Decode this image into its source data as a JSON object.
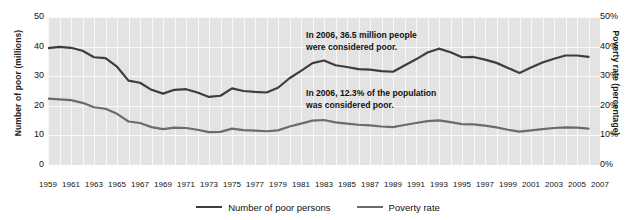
{
  "chart_data": {
    "type": "line",
    "title": "",
    "subtitle": "",
    "xlabel": "",
    "ylabel": "Number of poor (millions)",
    "y2label": "Poverty rate (percentage)",
    "grid": true,
    "legend_position": "bottom",
    "xlim": [
      1959,
      2007
    ],
    "ylim": [
      0,
      50
    ],
    "y2lim": [
      0,
      50
    ],
    "y_ticks": [
      "0",
      "10",
      "20",
      "30",
      "40",
      "50"
    ],
    "y_tick_values": [
      0,
      10,
      20,
      30,
      40,
      50
    ],
    "y2_ticks": [
      "0%",
      "10%",
      "20%",
      "30%",
      "40%",
      "50%"
    ],
    "y2_tick_values": [
      0,
      10,
      20,
      30,
      40,
      50
    ],
    "x_ticks": [
      "1959",
      "1961",
      "1963",
      "1965",
      "1967",
      "1969",
      "1971",
      "1973",
      "1975",
      "1977",
      "1979",
      "1981",
      "1983",
      "1985",
      "1987",
      "1989",
      "1991",
      "1993",
      "1995",
      "1997",
      "1999",
      "2001",
      "2003",
      "2005",
      "2007"
    ],
    "x": [
      1959,
      1960,
      1961,
      1962,
      1963,
      1964,
      1965,
      1966,
      1967,
      1968,
      1969,
      1970,
      1971,
      1972,
      1973,
      1974,
      1975,
      1976,
      1977,
      1978,
      1979,
      1980,
      1981,
      1982,
      1983,
      1984,
      1985,
      1986,
      1987,
      1988,
      1989,
      1990,
      1991,
      1992,
      1993,
      1994,
      1995,
      1996,
      1997,
      1998,
      1999,
      2000,
      2001,
      2002,
      2003,
      2004,
      2005,
      2006
    ],
    "series": [
      {
        "name": "Number of poor persons",
        "unit": "millions",
        "axis": "left",
        "color": "#3d3d3d",
        "values": [
          39.5,
          39.9,
          39.6,
          38.6,
          36.4,
          36.1,
          33.2,
          28.5,
          27.8,
          25.4,
          24.1,
          25.4,
          25.6,
          24.5,
          23.0,
          23.4,
          25.9,
          25.0,
          24.7,
          24.5,
          26.1,
          29.3,
          31.8,
          34.4,
          35.3,
          33.7,
          33.1,
          32.4,
          32.2,
          31.7,
          31.5,
          33.6,
          35.7,
          38.0,
          39.3,
          38.1,
          36.4,
          36.5,
          35.6,
          34.5,
          32.8,
          31.1,
          32.9,
          34.6,
          35.9,
          37.0,
          37.0,
          36.5
        ]
      },
      {
        "name": "Poverty rate",
        "unit": "percent",
        "axis": "right",
        "color": "#6b6b6b",
        "values": [
          22.4,
          22.2,
          21.9,
          21.0,
          19.5,
          19.0,
          17.3,
          14.7,
          14.2,
          12.8,
          12.1,
          12.6,
          12.5,
          11.9,
          11.1,
          11.2,
          12.3,
          11.8,
          11.6,
          11.4,
          11.7,
          13.0,
          14.0,
          15.0,
          15.2,
          14.4,
          14.0,
          13.6,
          13.4,
          13.0,
          12.8,
          13.5,
          14.2,
          14.8,
          15.1,
          14.5,
          13.8,
          13.7,
          13.3,
          12.7,
          11.9,
          11.3,
          11.7,
          12.1,
          12.5,
          12.7,
          12.6,
          12.3
        ]
      }
    ],
    "annotations": [
      {
        "id": "number-annotation",
        "line1": "In 2006, 36.5 million people",
        "line2": "were considered poor."
      },
      {
        "id": "rate-annotation",
        "line1": "In 2006, 12.3% of the population",
        "line2": "was considered poor."
      }
    ]
  },
  "legend": {
    "items": [
      {
        "label": "Number of poor persons",
        "color": "#3d3d3d"
      },
      {
        "label": "Poverty rate",
        "color": "#6b6b6b"
      }
    ]
  },
  "colors": {
    "plot_background": "#e3e3e3",
    "gridline": "#f7f7f7",
    "number_line": "#3d3d3d",
    "rate_line": "#6b6b6b",
    "text": "#111111"
  }
}
